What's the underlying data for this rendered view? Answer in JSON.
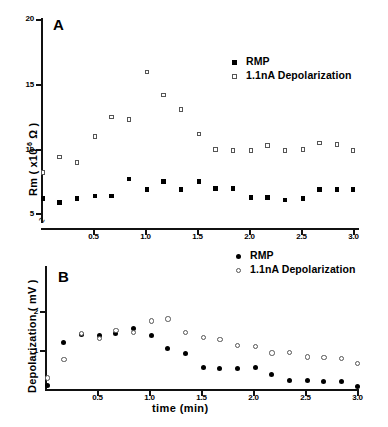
{
  "figure": {
    "panels": [
      {
        "letter": "A",
        "ylabel_html": "Rm ( x10<sup>-6</sup> Ω )",
        "ylabel_text": "Rm (x10-6 Ohm)",
        "xlabel": "",
        "yticks": [
          "5",
          "10",
          "15",
          "20"
        ],
        "xticks": [
          "0.5",
          "1.0",
          "1.5",
          "2.0",
          "2.5",
          "3.0"
        ],
        "legend": [
          {
            "label": "RMP",
            "marker": "filled-square"
          },
          {
            "label": "1.1nA Depolarization",
            "marker": "open-square"
          }
        ]
      },
      {
        "letter": "B",
        "ylabel_html": "Depolarization ( mV )",
        "ylabel_text": "Depolarization (mV)",
        "xlabel": "time (min)",
        "yticks": [
          "1",
          "2"
        ],
        "xticks": [
          "0.5",
          "1.0",
          "1.5",
          "2.0",
          "2.5",
          "3.0"
        ],
        "legend": [
          {
            "label": "RMP",
            "marker": "filled-circle"
          },
          {
            "label": "1.1nA Depolarization",
            "marker": "open-circle"
          }
        ]
      }
    ]
  },
  "chart_data": [
    {
      "type": "scatter",
      "panel": "A",
      "title": "",
      "xlabel": "time (min)",
      "ylabel": "Rm (x10^-6 Ω)",
      "xlim": [
        0,
        3.2
      ],
      "ylim": [
        5,
        20
      ],
      "grid": false,
      "legend_position": "upper-right",
      "axis_break": "y-axis broken below 5",
      "x": [
        0.02,
        0.18,
        0.35,
        0.52,
        0.68,
        0.85,
        1.02,
        1.18,
        1.35,
        1.52,
        1.68,
        1.85,
        2.02,
        2.18,
        2.35,
        2.52,
        2.68,
        2.85,
        3.0
      ],
      "series": [
        {
          "name": "RMP",
          "marker": "filled-square",
          "values": [
            6.1,
            5.8,
            6.1,
            6.3,
            6.3,
            7.6,
            6.8,
            7.4,
            6.8,
            7.4,
            6.9,
            6.9,
            6.2,
            6.2,
            6.0,
            6.1,
            6.8,
            6.8,
            6.8
          ]
        },
        {
          "name": "1.1nA Depolarization",
          "marker": "open-square",
          "values": [
            8.1,
            9.3,
            8.9,
            10.9,
            12.4,
            12.2,
            15.9,
            14.1,
            13.0,
            11.1,
            9.9,
            9.8,
            9.8,
            10.2,
            9.8,
            9.9,
            10.4,
            10.3,
            9.8
          ]
        }
      ]
    },
    {
      "type": "scatter",
      "panel": "B",
      "title": "",
      "xlabel": "time (min)",
      "ylabel": "Depolarization (mV)",
      "xlim": [
        0,
        3.2
      ],
      "ylim": [
        0,
        2.4
      ],
      "grid": false,
      "legend_position": "upper-right",
      "x": [
        0.02,
        0.18,
        0.35,
        0.52,
        0.68,
        0.85,
        1.02,
        1.18,
        1.35,
        1.52,
        1.68,
        1.85,
        2.02,
        2.18,
        2.35,
        2.52,
        2.68,
        2.85,
        3.0
      ],
      "series": [
        {
          "name": "RMP",
          "marker": "filled-circle",
          "values": [
            0.08,
            1.2,
            1.39,
            1.38,
            1.42,
            1.55,
            1.38,
            1.05,
            0.9,
            0.56,
            0.53,
            0.52,
            0.55,
            0.37,
            0.21,
            0.22,
            0.19,
            0.2,
            0.07
          ]
        },
        {
          "name": "1.1nA Depolarization",
          "marker": "open-circle",
          "values": [
            0.29,
            0.76,
            1.43,
            1.3,
            1.5,
            1.45,
            1.75,
            1.8,
            1.46,
            1.32,
            1.27,
            1.12,
            1.09,
            0.93,
            0.94,
            0.83,
            0.81,
            0.79,
            0.66
          ]
        }
      ]
    }
  ]
}
